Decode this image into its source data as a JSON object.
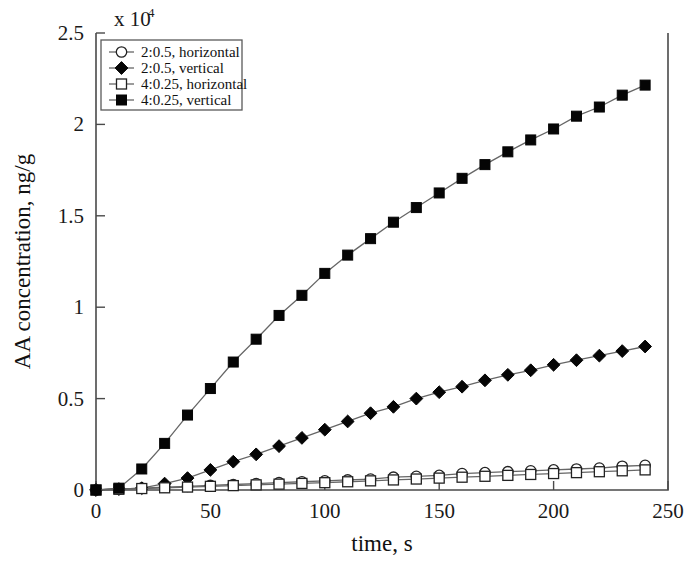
{
  "chart_data": {
    "type": "line",
    "title": "",
    "xlabel": "time, s",
    "ylabel": "AA concentration, ng/g",
    "y_multiplier_label": "x 10",
    "y_multiplier_exponent": "4",
    "xlim": [
      0,
      250
    ],
    "ylim": [
      0,
      2.5
    ],
    "xticks": [
      0,
      50,
      100,
      150,
      200,
      250
    ],
    "xticklabels": [
      "0",
      "50",
      "100",
      "150",
      "200",
      "250"
    ],
    "yticks": [
      0,
      0.5,
      1,
      1.5,
      2,
      2.5
    ],
    "yticklabels": [
      "0",
      "0.5",
      "1",
      "1.5",
      "2",
      "2.5"
    ],
    "grid": false,
    "legend_position": "upper-left",
    "x": [
      0,
      10,
      20,
      30,
      40,
      50,
      60,
      70,
      80,
      90,
      100,
      110,
      120,
      130,
      140,
      150,
      160,
      170,
      180,
      190,
      200,
      210,
      220,
      230,
      240
    ],
    "series": [
      {
        "name": "2:0.5, horizontal",
        "marker": "circle-open",
        "color": "#111111",
        "values": [
          0.0,
          0.005,
          0.01,
          0.015,
          0.02,
          0.025,
          0.03,
          0.035,
          0.04,
          0.045,
          0.05,
          0.055,
          0.06,
          0.07,
          0.075,
          0.08,
          0.09,
          0.095,
          0.1,
          0.105,
          0.11,
          0.115,
          0.12,
          0.13,
          0.135
        ]
      },
      {
        "name": "2:0.5, vertical",
        "marker": "diamond-filled",
        "color": "#050505",
        "values": [
          0.0,
          0.005,
          0.01,
          0.035,
          0.065,
          0.11,
          0.155,
          0.195,
          0.24,
          0.285,
          0.33,
          0.375,
          0.42,
          0.455,
          0.5,
          0.535,
          0.565,
          0.6,
          0.63,
          0.655,
          0.685,
          0.71,
          0.735,
          0.76,
          0.785
        ]
      },
      {
        "name": "4:0.25, horizontal",
        "marker": "square-open",
        "color": "#222222",
        "values": [
          0.0,
          0.004,
          0.008,
          0.012,
          0.016,
          0.02,
          0.024,
          0.028,
          0.032,
          0.036,
          0.04,
          0.045,
          0.05,
          0.055,
          0.06,
          0.065,
          0.07,
          0.075,
          0.08,
          0.085,
          0.09,
          0.095,
          0.1,
          0.105,
          0.11
        ]
      },
      {
        "name": "4:0.25, vertical",
        "marker": "square-filled",
        "color": "#050505",
        "values": [
          0.0,
          0.01,
          0.115,
          0.255,
          0.41,
          0.555,
          0.7,
          0.825,
          0.955,
          1.065,
          1.185,
          1.285,
          1.375,
          1.465,
          1.545,
          1.625,
          1.705,
          1.78,
          1.85,
          1.915,
          1.975,
          2.045,
          2.095,
          2.16,
          2.215
        ]
      }
    ]
  }
}
